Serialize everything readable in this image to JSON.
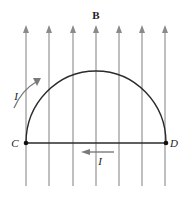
{
  "diagram": {
    "field_label": "B",
    "point_left": "C",
    "point_right": "D",
    "current_label_arc": "I",
    "current_label_diameter": "I",
    "field_line_count": 7,
    "colors": {
      "field_lines": "#8a8a8a",
      "wire": "#2a2a2a",
      "current_arrow": "#7a7a7a",
      "background": "#ffffff"
    }
  }
}
